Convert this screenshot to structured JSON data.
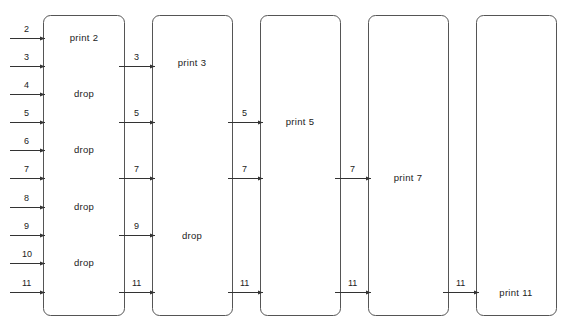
{
  "diagram": {
    "stages": [
      {
        "name": "stage-1",
        "inputs": [
          "2",
          "3",
          "4",
          "5",
          "6",
          "7",
          "8",
          "9",
          "10",
          "11"
        ],
        "actions": [
          {
            "text": "print 2",
            "row": 0
          },
          {
            "text": "drop",
            "row": 2
          },
          {
            "text": "drop",
            "row": 4
          },
          {
            "text": "drop",
            "row": 6
          },
          {
            "text": "drop",
            "row": 7.5
          }
        ]
      },
      {
        "name": "stage-2",
        "inputs": [
          "3",
          "5",
          "7",
          "9",
          "11"
        ],
        "actions": [
          {
            "text": "print 3",
            "row": 1
          },
          {
            "text": "drop",
            "row": 7
          }
        ]
      },
      {
        "name": "stage-3",
        "inputs": [
          "5",
          "7",
          "11"
        ],
        "actions": [
          {
            "text": "print 5",
            "row": 3
          }
        ]
      },
      {
        "name": "stage-4",
        "inputs": [
          "7",
          "11"
        ],
        "actions": [
          {
            "text": "print 7",
            "row": 5
          }
        ]
      },
      {
        "name": "stage-5",
        "inputs": [
          "11"
        ],
        "actions": [
          {
            "text": "print 11",
            "row": 9
          }
        ]
      }
    ],
    "labels": {
      "s1_in": [
        "2",
        "3",
        "4",
        "5",
        "6",
        "7",
        "8",
        "9",
        "10",
        "11"
      ],
      "s2_in": [
        "3",
        "5",
        "7",
        "9",
        "11"
      ],
      "s3_in": [
        "5",
        "7",
        "11"
      ],
      "s4_in": [
        "7",
        "11"
      ],
      "s5_in": [
        "11"
      ],
      "s1_act": [
        "print 2",
        "drop",
        "drop",
        "drop",
        "drop"
      ],
      "s2_act": [
        "print 3",
        "drop"
      ],
      "s3_act": [
        "print 5"
      ],
      "s4_act": [
        "print 7"
      ],
      "s5_act": [
        "print 11"
      ]
    }
  }
}
